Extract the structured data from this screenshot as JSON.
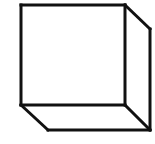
{
  "diagram": {
    "title": "Cube line drawing",
    "stroke_color": "#111111",
    "background": "#ffffff",
    "stroke_width": 3,
    "edges": [
      {
        "name": "front-top-edge",
        "x1": 21,
        "y1": 5,
        "x2": 125,
        "y2": 5
      },
      {
        "name": "front-left-edge",
        "x1": 21,
        "y1": 5,
        "x2": 21,
        "y2": 105
      },
      {
        "name": "front-right-edge",
        "x1": 125,
        "y1": 5,
        "x2": 125,
        "y2": 105
      },
      {
        "name": "front-bottom-edge",
        "x1": 21,
        "y1": 105,
        "x2": 125,
        "y2": 105
      },
      {
        "name": "top-right-diagonal-edge",
        "x1": 125,
        "y1": 5,
        "x2": 150,
        "y2": 29
      },
      {
        "name": "back-right-vertical-edge",
        "x1": 150,
        "y1": 29,
        "x2": 150,
        "y2": 130
      },
      {
        "name": "bottom-left-diagonal-edge",
        "x1": 21,
        "y1": 105,
        "x2": 48,
        "y2": 130
      },
      {
        "name": "bottom-back-edge",
        "x1": 48,
        "y1": 130,
        "x2": 150,
        "y2": 130
      },
      {
        "name": "bottom-right-diagonal-edge",
        "x1": 125,
        "y1": 105,
        "x2": 150,
        "y2": 130
      }
    ]
  }
}
